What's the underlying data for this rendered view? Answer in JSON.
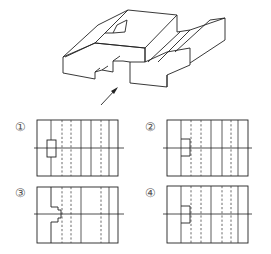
{
  "figure": {
    "type": "technical-drawing",
    "viewing_arrow": {
      "icon": "arrow-icon",
      "from": [
        101,
        105
      ],
      "to": [
        118,
        87
      ]
    }
  },
  "options": [
    {
      "label": "①",
      "id": 1,
      "feature": "closed rectangle notch"
    },
    {
      "label": "②",
      "id": 2,
      "feature": "open notch, right dashed"
    },
    {
      "label": "③",
      "id": 3,
      "feature": "stepped profile notch"
    },
    {
      "label": "④",
      "id": 4,
      "feature": "open notch, two right dashed"
    }
  ]
}
